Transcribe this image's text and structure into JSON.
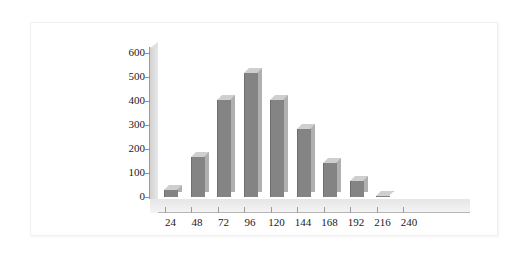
{
  "figure": {
    "background_color": "#ffffff",
    "frame_border_color": "#f0f0f0"
  },
  "chart_data": {
    "type": "bar",
    "title": "",
    "subtitle": "",
    "xlabel": "",
    "ylabel": "",
    "categories": [
      "24",
      "48",
      "72",
      "96",
      "120",
      "144",
      "168",
      "192",
      "216",
      "240"
    ],
    "values": [
      28,
      168,
      405,
      515,
      405,
      282,
      143,
      65,
      6,
      0
    ],
    "yticks": [
      0,
      100,
      200,
      300,
      400,
      500,
      600
    ],
    "xticks": [
      "24",
      "48",
      "72",
      "96",
      "120",
      "144",
      "168",
      "192",
      "216",
      "240"
    ],
    "ylim": [
      0,
      600
    ],
    "grid": false,
    "legend": "none",
    "style": "3d-column",
    "bar_face_color": "#848484",
    "bar_top_color": "#cfcfcf",
    "bar_side_color": "#b0b0b0",
    "axis_color": "#9a9a9a",
    "floor_color": "#ededed",
    "wall_color": "#dcdcdc",
    "tick_label_color": "#1a1a1a"
  }
}
